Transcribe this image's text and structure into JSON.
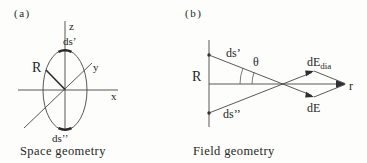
{
  "panel_a": {
    "tag": "(a)",
    "caption": "Space geometry",
    "axis_labels": {
      "z": "z",
      "y": "y",
      "x": "x"
    },
    "radius_label": "R",
    "current_element_top": "ds’",
    "current_element_bottom": "ds’’"
  },
  "panel_b": {
    "tag": "(b)",
    "caption": "Field geometry",
    "radius_label": "R",
    "source_element_top": "ds’",
    "source_element_bottom": "ds’’",
    "angle_label": "θ",
    "field_vector_dia_main": "dE",
    "field_vector_dia_sub": "dia",
    "field_vector": "dE",
    "resultant_axis_label": "r"
  },
  "colors": {
    "line": "#454545",
    "text": "#262626",
    "background": "#fdfdfc"
  }
}
